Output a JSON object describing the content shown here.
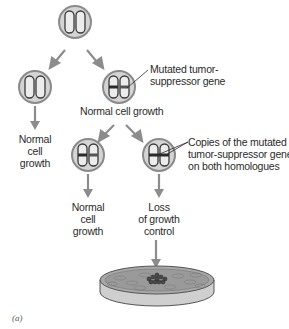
{
  "figure": {
    "caption": "(a)",
    "colors": {
      "cell_fill": "#d4d4d4",
      "cell_border": "#8a8a8a",
      "chromosome_fill": "#e8e8e8",
      "chromosome_outline": "#3a3a3a",
      "mutation_band": "#2a2a2a",
      "arrow": "#8c8c8c",
      "text": "#2a2a2a",
      "dish_fill": "#9a9a9a"
    },
    "nodes": [
      {
        "id": "top",
        "label": "",
        "mutations": 0
      },
      {
        "id": "left",
        "label": "",
        "mutations": 0
      },
      {
        "id": "right",
        "label": "Normal cell growth",
        "mutations": 1
      },
      {
        "id": "bottom-left",
        "label": "",
        "mutations": 1
      },
      {
        "id": "bottom-right",
        "label": "",
        "mutations": 2
      }
    ],
    "labels": {
      "left_outcome": [
        "Normal",
        "cell",
        "growth"
      ],
      "right_cell_status": "Normal cell growth",
      "bottom_left_outcome": [
        "Normal",
        "cell",
        "growth"
      ],
      "bottom_right_outcome": [
        "Loss",
        "of growth",
        "control"
      ]
    },
    "annotations": {
      "mutated_gene": [
        "Mutated tumor-",
        "suppressor gene"
      ],
      "both_copies": [
        "Copies of the mutated",
        "tumor-suppressor gene",
        "on both homologues"
      ]
    },
    "endpoint": "culture-dish-with-tumor-cluster"
  }
}
